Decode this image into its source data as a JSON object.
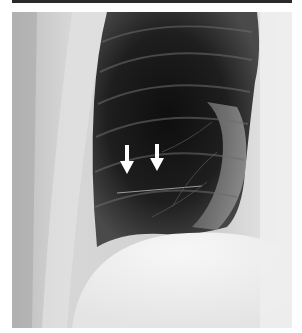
{
  "figure": {
    "type": "chest-radiograph",
    "view": "frontal, left hemithorax",
    "annotations": [
      {
        "kind": "arrow",
        "direction": "down",
        "color": "#ffffff",
        "x": 127,
        "y_top": 145,
        "y_tip": 173
      },
      {
        "kind": "arrow",
        "direction": "down",
        "color": "#ffffff",
        "x": 157,
        "y_top": 144,
        "y_tip": 170
      }
    ],
    "colors": {
      "background": "#ffffff",
      "top_rule": "#2a2a2a",
      "lung_dark": "#151515",
      "soft_tissue": "#e6e6e6"
    }
  }
}
